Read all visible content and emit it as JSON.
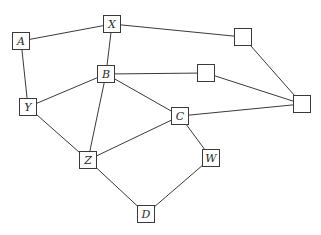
{
  "diagram": {
    "type": "graph",
    "nodes": [
      {
        "id": "X",
        "label": "X",
        "cx": 112,
        "cy": 24
      },
      {
        "id": "A",
        "label": "A",
        "cx": 21,
        "cy": 41
      },
      {
        "id": "B",
        "label": "B",
        "cx": 106,
        "cy": 74
      },
      {
        "id": "Y",
        "label": "Y",
        "cx": 28,
        "cy": 107
      },
      {
        "id": "U1",
        "label": "",
        "cx": 243,
        "cy": 37
      },
      {
        "id": "U2",
        "label": "",
        "cx": 206,
        "cy": 73
      },
      {
        "id": "U3",
        "label": "",
        "cx": 302,
        "cy": 104
      },
      {
        "id": "C",
        "label": "C",
        "cx": 180,
        "cy": 116
      },
      {
        "id": "Z",
        "label": "Z",
        "cx": 88,
        "cy": 160
      },
      {
        "id": "W",
        "label": "W",
        "cx": 211,
        "cy": 158
      },
      {
        "id": "D",
        "label": "D",
        "cx": 146,
        "cy": 214
      }
    ],
    "edges": [
      [
        "A",
        "X"
      ],
      [
        "A",
        "Y"
      ],
      [
        "X",
        "B"
      ],
      [
        "X",
        "U1"
      ],
      [
        "B",
        "Y"
      ],
      [
        "B",
        "U2"
      ],
      [
        "B",
        "Z"
      ],
      [
        "B",
        "C"
      ],
      [
        "U2",
        "U3"
      ],
      [
        "U1",
        "U3"
      ],
      [
        "C",
        "U3"
      ],
      [
        "C",
        "Z"
      ],
      [
        "C",
        "W"
      ],
      [
        "Y",
        "Z"
      ],
      [
        "Z",
        "D"
      ],
      [
        "W",
        "D"
      ]
    ],
    "colors": {
      "stroke": "#3a3a3a",
      "background": "#ffffff",
      "text": "#2a2a2a"
    }
  }
}
